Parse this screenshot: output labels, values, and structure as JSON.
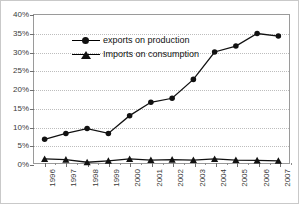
{
  "chart_data": {
    "type": "line",
    "title": "",
    "subtitle": "",
    "xlabel": "",
    "ylabel": "",
    "grid": true,
    "legend_position": "top-left",
    "ylim": [
      0,
      40
    ],
    "ytick_labels": [
      "40%",
      "35%",
      "30%",
      "25%",
      "20%",
      "15%",
      "10%",
      "5%",
      "0%"
    ],
    "ytick_values": [
      40,
      35,
      30,
      25,
      20,
      15,
      10,
      5,
      0
    ],
    "categories": [
      "1996",
      "1997",
      "1998",
      "1999",
      "2000",
      "2001",
      "2002",
      "2003",
      "2004",
      "2005",
      "2006",
      "2007"
    ],
    "series": [
      {
        "name": "exports on production",
        "marker": "circle",
        "color": "#111111",
        "values": [
          6.4,
          8.0,
          9.3,
          8.0,
          12.8,
          16.4,
          17.5,
          22.6,
          30.0,
          31.6,
          35.0,
          34.3
        ]
      },
      {
        "name": "Imports on consumption",
        "marker": "triangle",
        "color": "#111111",
        "values": [
          1.1,
          0.9,
          0.2,
          0.6,
          1.1,
          0.8,
          0.9,
          0.8,
          1.1,
          0.8,
          0.7,
          0.6
        ]
      }
    ]
  },
  "legend": {
    "items": [
      {
        "label": "exports on production",
        "marker": "circle-marker-icon"
      },
      {
        "label": "Imports on consumption",
        "marker": "triangle-marker-icon"
      }
    ]
  }
}
